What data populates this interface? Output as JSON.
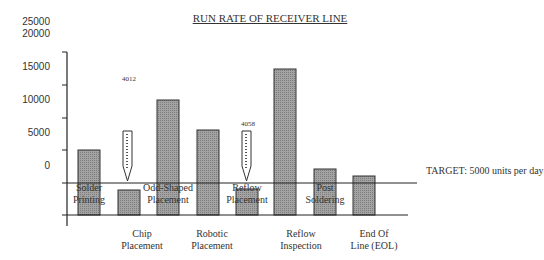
{
  "chart_data": {
    "type": "bar",
    "title": "RUN RATE OF RECEIVER LINE",
    "xlabel": "",
    "ylabel": "",
    "y_tick_labels": [
      "25000",
      "20000",
      "15000",
      "10000",
      "5000",
      "0"
    ],
    "categories": [
      "Solder Printing",
      "Chip Placement",
      "Odd-Shaped Placement",
      "Robotic Placement",
      "Reflow Placement",
      "Reflow Inspection",
      "Post Soldering",
      "End Of Line (EOL)"
    ],
    "values": [
      7500,
      1500,
      15000,
      10500,
      1800,
      22000,
      6900,
      5800
    ],
    "annotations": [
      {
        "text": "4012",
        "category": "Chip Placement"
      },
      {
        "text": "4058",
        "category": "Reflow Placement"
      }
    ],
    "target": {
      "value": 5000,
      "label": "TARGET: 5000 units per day"
    },
    "legend": "none",
    "grid": false
  },
  "title": "RUN RATE OF RECEIVER LINE",
  "y_axis": {
    "labels": [
      {
        "text": "25000",
        "y": 16
      },
      {
        "text": "20000",
        "y": 28
      },
      {
        "text": "15000",
        "y": 61
      },
      {
        "text": "10000",
        "y": 94
      },
      {
        "text": "5000",
        "y": 127
      },
      {
        "text": "0",
        "y": 160
      }
    ]
  },
  "bars": [
    {
      "name": "Solder Printing",
      "x": 78,
      "top": 150
    },
    {
      "name": "Chip Placement",
      "x": 118,
      "top": 190
    },
    {
      "name": "Odd-Shaped Placement",
      "x": 157,
      "top": 100
    },
    {
      "name": "Robotic Placement",
      "x": 197,
      "top": 130
    },
    {
      "name": "Reflow Placement",
      "x": 236,
      "top": 189
    },
    {
      "name": "Reflow Inspection",
      "x": 274,
      "top": 69
    },
    {
      "name": "Post Soldering",
      "x": 314,
      "top": 169
    },
    {
      "name": "End Of Line (EOL)",
      "x": 353,
      "top": 176
    }
  ],
  "inner_labels": [
    {
      "line1": "Solder",
      "line2": "Printing",
      "x": 89
    },
    {
      "line1": "Odd-Shaped",
      "line2": "Placement",
      "x": 168
    },
    {
      "line1": "Reflow",
      "line2": "Placement",
      "x": 247
    },
    {
      "line1": "Post",
      "line2": "Soldering",
      "x": 325
    }
  ],
  "below_labels": [
    {
      "line1": "Chip",
      "line2": "Placement",
      "x": 142
    },
    {
      "line1": "Robotic",
      "line2": "Placement",
      "x": 212
    },
    {
      "line1": "Reflow",
      "line2": "Inspection",
      "x": 301
    },
    {
      "line1": "End Of",
      "line2": "Line (EOL)",
      "x": 374
    }
  ],
  "notes": [
    {
      "text": "4012",
      "x": 122,
      "y": 75
    },
    {
      "text": "4058",
      "x": 241,
      "y": 120
    }
  ],
  "target_label": "TARGET: 5000 units per day",
  "colors": {
    "bar_fill": "#9a9a9a",
    "bar_stroke": "#333333",
    "axis": "#222222"
  }
}
